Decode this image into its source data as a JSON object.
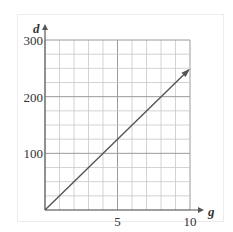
{
  "chart_data": {
    "type": "line",
    "title": "",
    "xlabel": "g",
    "ylabel": "d",
    "xlim": [
      0,
      10
    ],
    "ylim": [
      0,
      300
    ],
    "grid": true,
    "x_ticks": [
      5,
      10
    ],
    "y_ticks": [
      100,
      200,
      300
    ],
    "x_tick_labels": [
      "5",
      "10"
    ],
    "y_tick_labels": [
      "100",
      "200",
      "300"
    ],
    "x_minor_step": 1,
    "y_minor_step": 25,
    "series": [
      {
        "name": "d vs g",
        "x": [
          0,
          9.9
        ],
        "y": [
          0,
          247
        ],
        "arrow_end": true,
        "equation": "d = 25g"
      }
    ],
    "legend": null
  },
  "colors": {
    "grid": "#c8c8c8",
    "major_grid": "#9a9a9a",
    "axis": "#555555",
    "line": "#555555",
    "text": "#333333"
  }
}
